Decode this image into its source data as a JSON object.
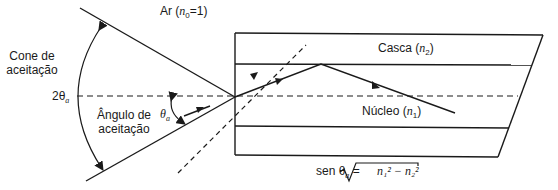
{
  "diagram": {
    "labels": {
      "acceptance_cone": [
        "Cone de",
        "aceitação"
      ],
      "double_angle": "2θ",
      "double_angle_sub": "a",
      "acceptance_angle": [
        "Ângulo de",
        "aceitação"
      ],
      "theta_a": "θ",
      "theta_a_sub": "a",
      "air": "Ar (",
      "air_n": "n",
      "air_n_sub": "0",
      "air_value": "=1)",
      "cladding": "Casca (",
      "cladding_n": "n",
      "cladding_n_sub": "2",
      "cladding_close": ")",
      "core": "Núcleo (",
      "core_n": "n",
      "core_n_sub": "1",
      "core_close": ")"
    },
    "formula": {
      "lhs": "sen θ",
      "lhs_sub": "a",
      "equals": "=",
      "rhs": "n₁² − n₂²"
    },
    "colors": {
      "line": "#1a1a1a",
      "background": "#ffffff"
    }
  }
}
